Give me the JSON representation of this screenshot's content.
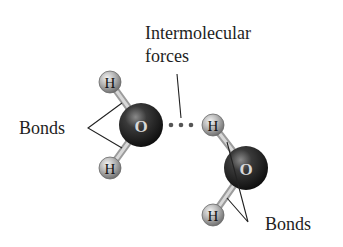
{
  "diagram": {
    "labels": {
      "intermolecular_line1": "Intermolecular",
      "intermolecular_line2": "forces",
      "bonds_left": "Bonds",
      "bonds_right": "Bonds"
    },
    "molecules": [
      {
        "name": "water-molecule-left",
        "atoms": [
          {
            "symbol": "H",
            "role": "hydrogen-top"
          },
          {
            "symbol": "O",
            "role": "oxygen"
          },
          {
            "symbol": "H",
            "role": "hydrogen-bottom"
          }
        ]
      },
      {
        "name": "water-molecule-right",
        "atoms": [
          {
            "symbol": "H",
            "role": "hydrogen-top"
          },
          {
            "symbol": "O",
            "role": "oxygen"
          },
          {
            "symbol": "H",
            "role": "hydrogen-bottom"
          }
        ]
      }
    ],
    "atom_symbols": {
      "h1": "H",
      "o1": "O",
      "h2": "H",
      "h3": "H",
      "o2": "O",
      "h4": "H"
    },
    "colors": {
      "oxygen": "#1c1c1c",
      "hydrogen": "#9a9a9a",
      "bond": "#b8b8b8",
      "text": "#1e1e1e",
      "background": "#ffffff"
    }
  }
}
